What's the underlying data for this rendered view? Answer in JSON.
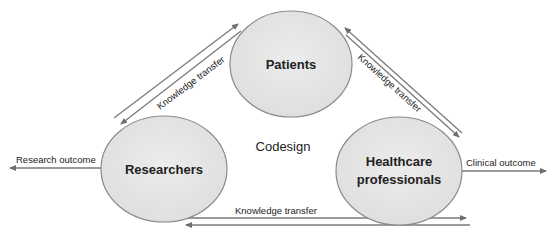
{
  "diagram": {
    "center_label": "Codesign",
    "nodes": [
      {
        "id": "patients",
        "label": "Patients"
      },
      {
        "id": "researchers",
        "label": "Researchers"
      },
      {
        "id": "healthcare",
        "label_line1": "Healthcare",
        "label_line2": "professionals"
      }
    ],
    "edges": [
      {
        "from": "researchers",
        "to": "patients",
        "label": "Knowledge transfer",
        "bidirectional": true
      },
      {
        "from": "patients",
        "to": "healthcare",
        "label": "Knowledge transfer",
        "bidirectional": true
      },
      {
        "from": "researchers",
        "to": "healthcare",
        "label": "Knowledge transfer",
        "bidirectional": true
      }
    ],
    "outputs": [
      {
        "from": "researchers",
        "label": "Research outcome",
        "direction": "left"
      },
      {
        "from": "healthcare",
        "label": "Clinical outcome",
        "direction": "right"
      }
    ],
    "colors": {
      "node_fill": "#e6e6e6",
      "node_stroke": "#8a8a8a",
      "arrow": "#7a7a7a",
      "text": "#222222"
    }
  }
}
